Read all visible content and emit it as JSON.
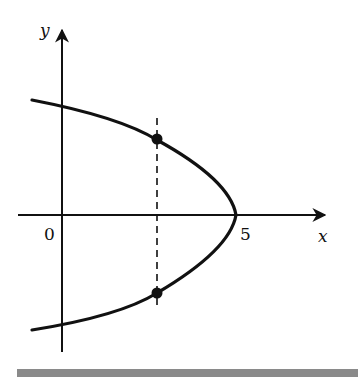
{
  "diagram": {
    "type": "parabola-graph",
    "equation_form": "x = 5 - k*y^2 (opening left)",
    "axes": {
      "x_label": "x",
      "y_label": "y",
      "origin_label": "0",
      "x_tick_label": "5"
    },
    "curve": {
      "vertex": [
        5,
        0
      ],
      "opens": "left"
    },
    "vertical_line": {
      "style": "dashed",
      "x_approx": 2.7
    },
    "points": [
      {
        "name": "upper-intersection",
        "filled": true
      },
      {
        "name": "lower-intersection",
        "filled": true
      }
    ],
    "colors": {
      "ink": "#111111",
      "bar": "#8a8a8a"
    }
  }
}
